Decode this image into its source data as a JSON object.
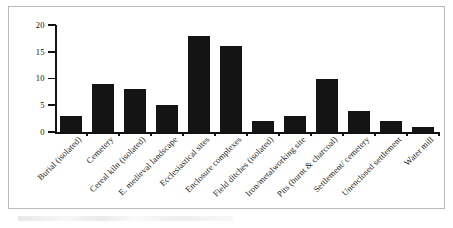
{
  "figure": {
    "frame_border_color": "#b9b9b9",
    "background_color": "#ffffff"
  },
  "chart_data": {
    "type": "bar",
    "title": "",
    "xlabel": "",
    "ylabel": "",
    "ylim": [
      0,
      20
    ],
    "yticks": [
      0,
      5,
      10,
      15,
      20
    ],
    "grid": false,
    "legend": null,
    "bar_color": "#141414",
    "axis_color": "#111111",
    "categories": [
      "Burial (isolated)",
      "Cemetery",
      "Cereal kiln (isolated)",
      "E. medieval landscape",
      "Ecclesiastical sites",
      "Enclosure complexes",
      "Field ditches (isolated)",
      "Iron/metalworking site",
      "Pits (burnt & charcoal)",
      "Settlement/ cemetery",
      "Unenclosed settlement",
      "Water mill"
    ],
    "values": [
      3,
      9,
      8,
      5,
      18,
      16,
      2,
      3,
      10,
      4,
      2,
      1
    ]
  }
}
